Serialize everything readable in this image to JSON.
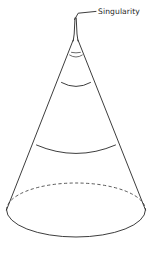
{
  "figure": {
    "background_color": "#ffffff",
    "stroke_color": "#272727",
    "width": 153,
    "height": 260,
    "annotations": [
      {
        "id": "singularity",
        "label": "Singularity",
        "label_x": 98,
        "label_y": 14,
        "leader_from_x": 74.5,
        "leader_from_y": 19.5,
        "leader_elbow_x": 78,
        "leader_elbow_y": 13.5,
        "leader_to_x": 96,
        "leader_to_y": 11.5
      }
    ],
    "geometry": {
      "apex_x": 75.5,
      "apex_y": 18.0,
      "base_center_x": 76.0,
      "base_center_y": 210.0,
      "base_radius_x": 69.5,
      "base_radius_y": 27.0,
      "spike": {
        "left_x_top": 74.6,
        "right_x_top": 76.4,
        "left_x_bottom": 71.0,
        "right_x_bottom": 80.0,
        "neck_y": 52.0
      },
      "cross_sections": [
        {
          "id": "neck-tick",
          "center_y": 52.0,
          "half_width": 4.5,
          "sag": 1.0
        },
        {
          "id": "arc-upper",
          "center_y": 56.0,
          "half_width": 7.0,
          "sag": 2.6
        },
        {
          "id": "arc-middle",
          "center_y": 85.0,
          "half_width": 15.0,
          "sag": 5.0
        },
        {
          "id": "arc-lower",
          "center_y": 150.0,
          "half_width": 40.0,
          "sag": 11.5
        }
      ],
      "base_ellipse": {
        "front_arc_solid": true,
        "back_arc_dashed": true
      }
    }
  }
}
